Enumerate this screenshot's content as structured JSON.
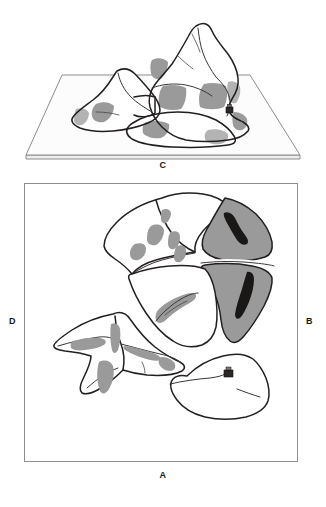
{
  "figure": {
    "background_color": "#ffffff",
    "ink_color": "#231f1f",
    "shade_gray": "#9a9a9a",
    "shade_dark": "#1a1717",
    "frame_color": "#8d8d8d",
    "width_px": 326,
    "height_px": 507
  },
  "perspective_view": {
    "name": "oblique-block-diagram",
    "caption": "C",
    "description": "Oblique three-dimensional block diagram of a mountain massif resting on a thin rectangular base plate, with shaded slope facets and a small structure marker on the right ridge.",
    "base_plate": {
      "visible": true,
      "top_face_color": "#fcfcfc",
      "edge_face_color": "#ededed"
    },
    "markers": [
      {
        "name": "structure-marker",
        "label": ""
      }
    ]
  },
  "plan_view": {
    "name": "plan-map-frame",
    "frame": {
      "border_color": "#8d8d8d",
      "fill": "#ffffff"
    },
    "edge_labels": {
      "left": "D",
      "right": "B",
      "bottom": "A",
      "top": "C"
    },
    "features": [
      {
        "name": "north-massif",
        "shading": "light"
      },
      {
        "name": "east-shaded-block",
        "shading": "gray",
        "has_dark_streaks": true
      },
      {
        "name": "southwest-ridge",
        "shading": "gray-streaks"
      },
      {
        "name": "south-lobe",
        "shading": "none",
        "has_structure_marker": true
      },
      {
        "name": "central-crescent",
        "shading": "gray"
      }
    ],
    "markers": [
      {
        "name": "structure-marker",
        "label": ""
      }
    ]
  },
  "labels": {
    "a": "A",
    "b": "B",
    "c": "C",
    "d": "D"
  }
}
